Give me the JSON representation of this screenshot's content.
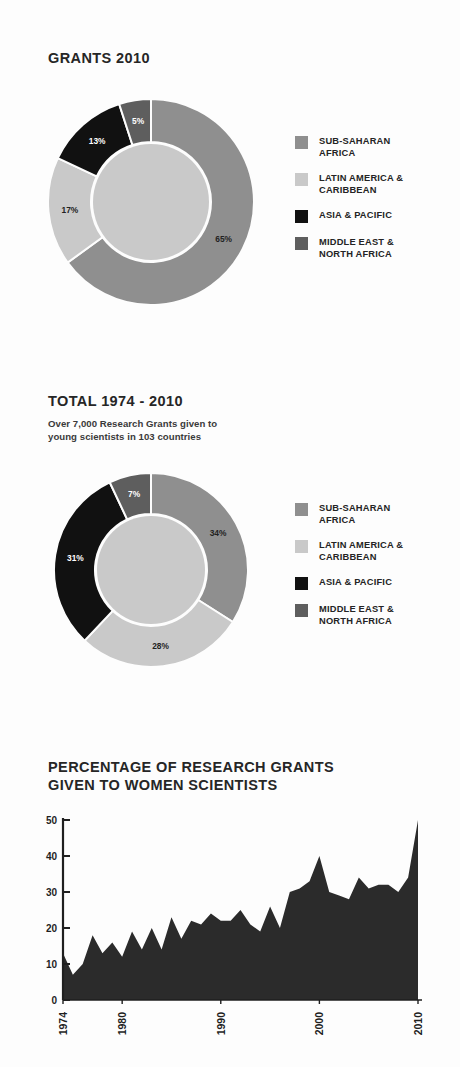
{
  "page": {
    "background": "#fdfdfd",
    "text_color": "#262626"
  },
  "palette": {
    "sub_saharan_africa": "#8f8f8f",
    "latin_america_caribbean": "#c9c9c9",
    "asia_pacific": "#111111",
    "middle_east_north_africa": "#5e5e5e",
    "area_fill": "#2b2b2b",
    "axis": "#1f1f1f"
  },
  "legend_items": [
    {
      "label": "SUB-SAHARAN\nAFRICA",
      "color": "#8f8f8f",
      "key": "sub-saharan-africa"
    },
    {
      "label": "LATIN AMERICA &\nCARIBBEAN",
      "color": "#c9c9c9",
      "key": "latin-america-caribbean"
    },
    {
      "label": "ASIA & PACIFIC",
      "color": "#111111",
      "key": "asia-pacific"
    },
    {
      "label": "MIDDLE EAST &\nNORTH AFRICA",
      "color": "#5e5e5e",
      "key": "middle-east-north-africa"
    }
  ],
  "sections": {
    "grants_2010": {
      "title": "GRANTS 2010",
      "subtitle": ""
    },
    "total_1974_2010": {
      "title": "TOTAL 1974 - 2010",
      "subtitle": "Over 7,000 Research Grants given to\nyoung scientists in 103 countries"
    },
    "women_scientists": {
      "title": "PERCENTAGE OF RESEARCH GRANTS\nGIVEN TO WOMEN SCIENTISTS"
    }
  },
  "chart_data": [
    {
      "id": "grants-2010-donut",
      "type": "pie",
      "title": "GRANTS 2010",
      "subtitle": "",
      "donut": true,
      "legend_position": "right",
      "categories": [
        "SUB-SAHARAN AFRICA",
        "LATIN AMERICA & CARIBBEAN",
        "ASIA & PACIFIC",
        "MIDDLE EAST & NORTH AFRICA"
      ],
      "values": [
        65,
        17,
        13,
        5
      ],
      "value_labels": [
        "65%",
        "17%",
        "13%",
        "5%"
      ],
      "colors": [
        "#8f8f8f",
        "#c9c9c9",
        "#111111",
        "#5e5e5e"
      ],
      "note_inner_disc_color": "#c9c9c9"
    },
    {
      "id": "total-1974-2010-donut",
      "type": "pie",
      "title": "TOTAL 1974 - 2010",
      "subtitle": "Over 7,000 Research Grants given to young scientists in 103 countries",
      "donut": true,
      "legend_position": "right",
      "categories": [
        "SUB-SAHARAN AFRICA",
        "LATIN AMERICA & CARIBBEAN",
        "ASIA & PACIFIC",
        "MIDDLE EAST & NORTH AFRICA"
      ],
      "values": [
        34,
        28,
        31,
        7
      ],
      "value_labels": [
        "34%",
        "28%",
        "31%",
        "7%"
      ],
      "colors": [
        "#8f8f8f",
        "#c9c9c9",
        "#111111",
        "#5e5e5e"
      ],
      "note_inner_disc_color": "#c9c9c9"
    },
    {
      "id": "women-scientists-area",
      "type": "area",
      "title": "PERCENTAGE OF RESEARCH GRANTS GIVEN TO WOMEN SCIENTISTS",
      "xlabel": "",
      "ylabel": "",
      "ylim": [
        0,
        50
      ],
      "xlim": [
        1974,
        2010
      ],
      "yticks": [
        0,
        10,
        20,
        30,
        40,
        50
      ],
      "ytick_labels": [
        "0",
        "10",
        "20",
        "30",
        "40",
        "50"
      ],
      "xticks": [
        1974,
        1980,
        1990,
        2000,
        2010
      ],
      "xtick_labels": [
        "1974",
        "1980",
        "1990",
        "2000",
        "2010"
      ],
      "xtick_rotation": -90,
      "grid": false,
      "fill_color": "#2b2b2b",
      "x": [
        1974,
        1975,
        1976,
        1977,
        1978,
        1979,
        1980,
        1981,
        1982,
        1983,
        1984,
        1985,
        1986,
        1987,
        1988,
        1989,
        1990,
        1991,
        1992,
        1993,
        1994,
        1995,
        1996,
        1997,
        1998,
        1999,
        2000,
        2001,
        2002,
        2003,
        2004,
        2005,
        2006,
        2007,
        2008,
        2009,
        2010
      ],
      "values": [
        13,
        7,
        10,
        18,
        13,
        16,
        12,
        19,
        14,
        20,
        14,
        23,
        17,
        22,
        21,
        24,
        22,
        22,
        25,
        21,
        19,
        26,
        20,
        30,
        31,
        33,
        40,
        30,
        29,
        28,
        34,
        31,
        32,
        32,
        30,
        34,
        50
      ]
    }
  ]
}
